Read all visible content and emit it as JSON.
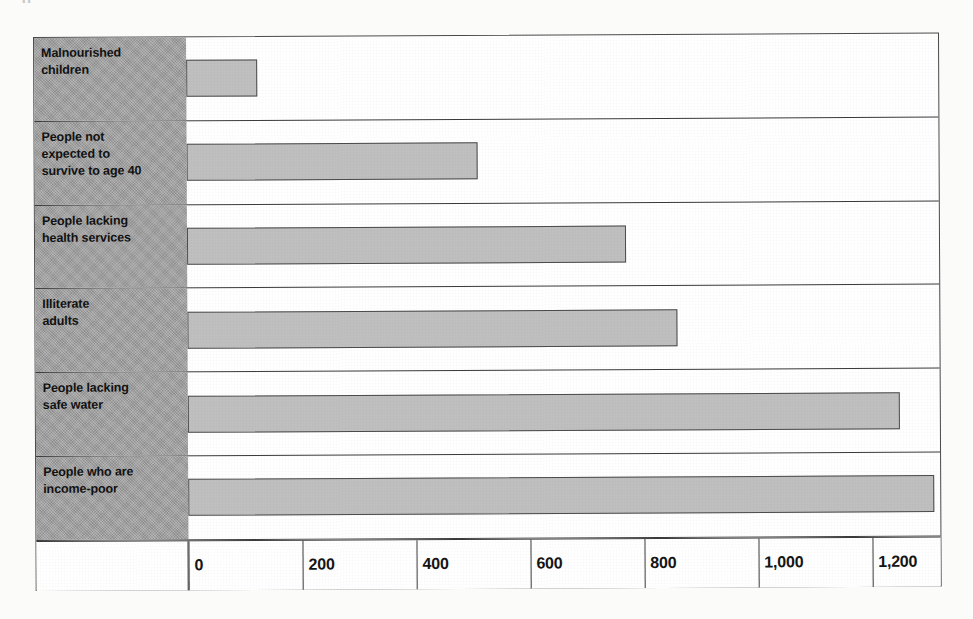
{
  "page": {
    "top_cut_text": "g",
    "background_note": "scanned page"
  },
  "chart_data": {
    "type": "bar",
    "orientation": "horizontal",
    "title": "",
    "subtitle": "",
    "xlabel": "",
    "ylabel": "",
    "categories": [
      "Malnourished children",
      "People not expected to survive to age 40",
      "People lacking health services",
      "Illiterate adults",
      "People lacking safe water",
      "People who are income-poor"
    ],
    "values": [
      125,
      510,
      770,
      860,
      1250,
      1310
    ],
    "xlim": [
      0,
      1320
    ],
    "xticks": [
      0,
      200,
      400,
      600,
      800,
      1000,
      1200
    ],
    "xticklabels": [
      "0",
      "200",
      "400",
      "600",
      "800",
      "1,000",
      "1,200"
    ],
    "grid": true,
    "legend": false,
    "bar_color": "#bfbfbf",
    "bar_edge_color": "#4c4c4c",
    "label_panel_color": "#9d9d9d",
    "frame_color": "#3b3b3b"
  },
  "rows": [
    {
      "label_lines": [
        "Malnourished",
        "children"
      ],
      "value": 125
    },
    {
      "label_lines": [
        "People not",
        "expected to",
        "survive to age 40"
      ],
      "value": 510
    },
    {
      "label_lines": [
        "People lacking",
        "health services"
      ],
      "value": 770
    },
    {
      "label_lines": [
        "Illiterate",
        "adults"
      ],
      "value": 860
    },
    {
      "label_lines": [
        "People lacking",
        "safe water"
      ],
      "value": 1250
    },
    {
      "label_lines": [
        "People who are",
        "income-poor"
      ],
      "value": 1310
    }
  ],
  "axis": {
    "ticks": [
      "0",
      "200",
      "400",
      "600",
      "800",
      "1,000",
      "1,200"
    ]
  }
}
